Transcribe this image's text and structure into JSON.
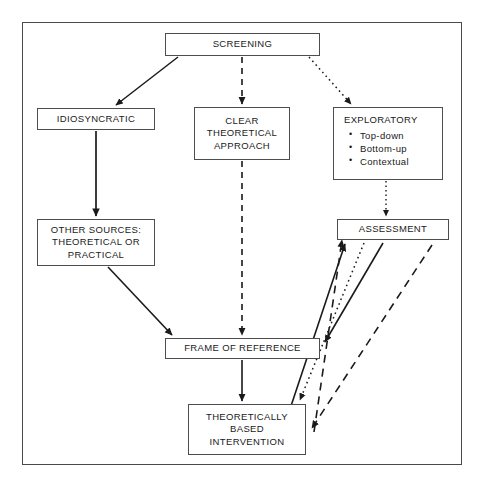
{
  "diagram": {
    "type": "flowchart",
    "title_present": false,
    "border_color": "#4a4a4a",
    "box_border_color": "#4d4d4d",
    "text_color": "#1a1a1a",
    "nodes": {
      "screening": {
        "label": "SCREENING"
      },
      "idiosyncratic": {
        "label": "IDIOSYNCRATIC"
      },
      "clear_theoretical": {
        "line1": "CLEAR",
        "line2": "THEORETICAL",
        "line3": "APPROACH"
      },
      "exploratory": {
        "title": "EXPLORATORY",
        "bullets": [
          "Top-down",
          "Bottom-up",
          "Contextual"
        ]
      },
      "other_sources": {
        "line1": "OTHER SOURCES:",
        "line2": "THEORETICAL OR",
        "line3": "PRACTICAL"
      },
      "assessment": {
        "label": "ASSESSMENT"
      },
      "frame_of_reference": {
        "label": "FRAME OF REFERENCE"
      },
      "theoretically_based": {
        "line1": "THEORETICALLY",
        "line2": "BASED",
        "line3": "INTERVENTION"
      }
    },
    "connectors": [
      {
        "id": "screening-to-idiosyncratic",
        "from": "screening",
        "to": "idiosyncratic",
        "style": "solid"
      },
      {
        "id": "screening-to-clear-theoretical",
        "from": "screening",
        "to": "clear_theoretical",
        "style": "dashed"
      },
      {
        "id": "screening-to-exploratory",
        "from": "screening",
        "to": "exploratory",
        "style": "dotted"
      },
      {
        "id": "idiosyncratic-to-other-sources",
        "from": "idiosyncratic",
        "to": "other_sources",
        "style": "solid"
      },
      {
        "id": "other-sources-to-frame-of-reference",
        "from": "other_sources",
        "to": "frame_of_reference",
        "style": "solid"
      },
      {
        "id": "clear-theoretical-to-frame-of-reference",
        "from": "clear_theoretical",
        "to": "frame_of_reference",
        "style": "dashed"
      },
      {
        "id": "exploratory-to-assessment",
        "from": "exploratory",
        "to": "assessment",
        "style": "dotted"
      },
      {
        "id": "frame-of-reference-to-theoretically-based",
        "from": "frame_of_reference",
        "to": "theoretically_based",
        "style": "solid"
      },
      {
        "id": "assessment-to-frame-of-reference",
        "from": "assessment",
        "to": "frame_of_reference",
        "style": "solid"
      },
      {
        "id": "theoretically-based-to-assessment",
        "from": "theoretically_based",
        "to": "assessment",
        "style": "solid"
      },
      {
        "id": "theoretically-based-to-assessment-dashed",
        "from": "theoretically_based",
        "to": "assessment",
        "style": "dashed"
      },
      {
        "id": "assessment-to-theoretically-based-dashed",
        "from": "assessment",
        "to": "theoretically_based",
        "style": "dashed"
      },
      {
        "id": "assessment-to-theoretically-based-dotted",
        "from": "assessment",
        "to": "theoretically_based",
        "style": "dotted"
      }
    ]
  }
}
